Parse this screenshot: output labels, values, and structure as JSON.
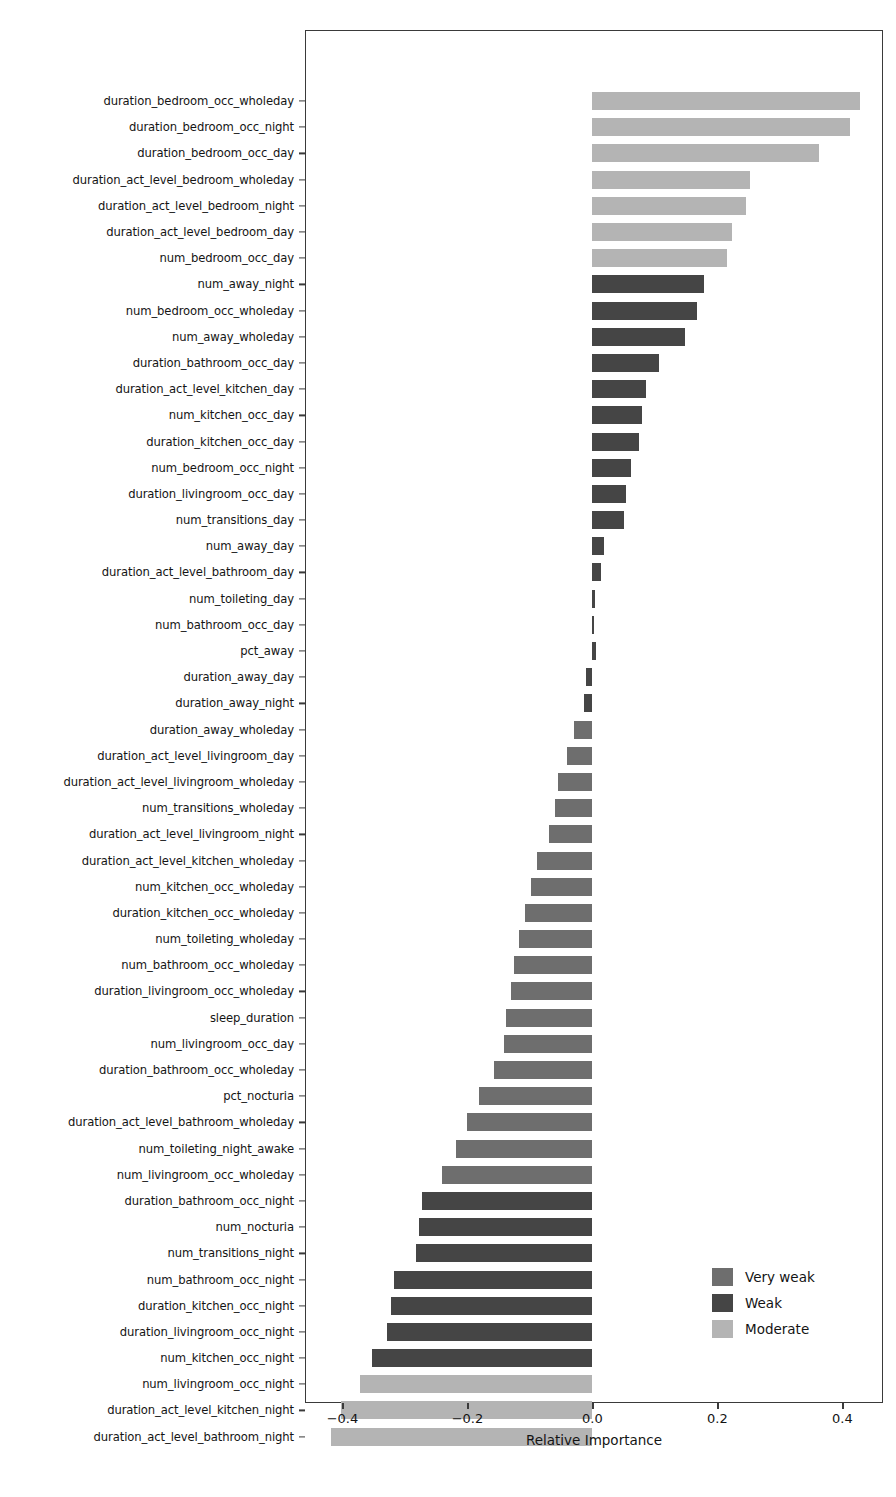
{
  "chart_data": {
    "type": "bar",
    "orientation": "horizontal",
    "title": "",
    "xlabel": "Relative Importance",
    "ylabel": "",
    "xlim": [
      -0.46,
      0.465
    ],
    "xticks": [
      -0.4,
      -0.2,
      0.0,
      0.2,
      0.4
    ],
    "xticklabels": [
      "−0.4",
      "−0.2",
      "0.0",
      "0.2",
      "0.4"
    ],
    "grid": false,
    "legend": {
      "position": "lower right",
      "entries": [
        {
          "label": "Very weak",
          "color": "#6e6e6e"
        },
        {
          "label": "Weak",
          "color": "#454545"
        },
        {
          "label": "Moderate",
          "color": "#b4b4b4"
        }
      ]
    },
    "colors": {
      "very_weak": "#6e6e6e",
      "weak": "#454545",
      "moderate": "#b4b4b4",
      "axis": "#3a3a3a",
      "text": "#141414",
      "background": "#ffffff"
    },
    "categories": [
      "duration_bedroom_occ_wholeday",
      "duration_bedroom_occ_night",
      "duration_bedroom_occ_day",
      "duration_act_level_bedroom_wholeday",
      "duration_act_level_bedroom_night",
      "duration_act_level_bedroom_day",
      "num_bedroom_occ_day",
      "num_away_night",
      "num_bedroom_occ_wholeday",
      "num_away_wholeday",
      "duration_bathroom_occ_day",
      "duration_act_level_kitchen_day",
      "num_kitchen_occ_day",
      "duration_kitchen_occ_day",
      "num_bedroom_occ_night",
      "duration_livingroom_occ_day",
      "num_transitions_day",
      "num_away_day",
      "duration_act_level_bathroom_day",
      "num_toileting_day",
      "num_bathroom_occ_day",
      "pct_away",
      "duration_away_day",
      "duration_away_night",
      "duration_away_wholeday",
      "duration_act_level_livingroom_day",
      "duration_act_level_livingroom_wholeday",
      "num_transitions_wholeday",
      "duration_act_level_livingroom_night",
      "duration_act_level_kitchen_wholeday",
      "num_kitchen_occ_wholeday",
      "duration_kitchen_occ_wholeday",
      "num_toileting_wholeday",
      "num_bathroom_occ_wholeday",
      "duration_livingroom_occ_wholeday",
      "sleep_duration",
      "num_livingroom_occ_day",
      "duration_bathroom_occ_wholeday",
      "pct_nocturia",
      "duration_act_level_bathroom_wholeday",
      "num_toileting_night_awake",
      "num_livingroom_occ_wholeday",
      "duration_bathroom_occ_night",
      "num_nocturia",
      "num_transitions_night",
      "num_bathroom_occ_night",
      "duration_kitchen_occ_night",
      "duration_livingroom_occ_night",
      "num_kitchen_occ_night",
      "num_livingroom_occ_night",
      "duration_act_level_kitchen_night",
      "duration_act_level_bathroom_night"
    ],
    "values": [
      0.428,
      0.412,
      0.362,
      0.252,
      0.245,
      0.223,
      0.215,
      0.178,
      0.167,
      0.148,
      0.106,
      0.086,
      0.08,
      0.074,
      0.062,
      0.053,
      0.05,
      0.018,
      0.014,
      0.004,
      0.003,
      0.006,
      -0.01,
      -0.014,
      -0.03,
      -0.04,
      -0.055,
      -0.06,
      -0.07,
      -0.088,
      -0.098,
      -0.108,
      -0.118,
      -0.125,
      -0.13,
      -0.138,
      -0.142,
      -0.158,
      -0.182,
      -0.2,
      -0.218,
      -0.24,
      -0.272,
      -0.278,
      -0.282,
      -0.318,
      -0.322,
      -0.328,
      -0.352,
      -0.372,
      -0.402,
      -0.418
    ],
    "strengths": [
      "moderate",
      "moderate",
      "moderate",
      "moderate",
      "moderate",
      "moderate",
      "moderate",
      "weak",
      "weak",
      "weak",
      "weak",
      "weak",
      "weak",
      "weak",
      "weak",
      "weak",
      "weak",
      "weak",
      "weak",
      "weak",
      "weak",
      "weak",
      "weak",
      "weak",
      "very_weak",
      "very_weak",
      "very_weak",
      "very_weak",
      "very_weak",
      "very_weak",
      "very_weak",
      "very_weak",
      "very_weak",
      "very_weak",
      "very_weak",
      "very_weak",
      "very_weak",
      "very_weak",
      "very_weak",
      "very_weak",
      "very_weak",
      "very_weak",
      "weak",
      "weak",
      "weak",
      "weak",
      "weak",
      "weak",
      "weak",
      "moderate",
      "moderate",
      "moderate"
    ]
  }
}
